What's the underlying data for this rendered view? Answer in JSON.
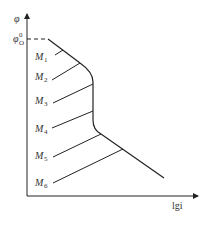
{
  "diagram": {
    "y_axis_label": "φ",
    "x_axis_label": "lgi",
    "origin_level_label": "φ",
    "origin_level_sup": "0",
    "origin_level_sub": "O",
    "curves": [
      {
        "label": "M",
        "sub": "1"
      },
      {
        "label": "M",
        "sub": "2"
      },
      {
        "label": "M",
        "sub": "3"
      },
      {
        "label": "M",
        "sub": "4"
      },
      {
        "label": "M",
        "sub": "5"
      },
      {
        "label": "M",
        "sub": "6"
      }
    ],
    "colors": {
      "line": "#222222",
      "text": "#333333"
    }
  }
}
